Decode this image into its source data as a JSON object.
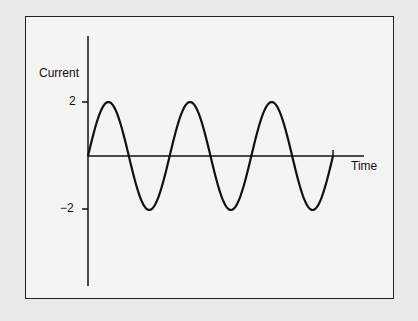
{
  "chart_data": {
    "type": "line",
    "title": "",
    "xlabel": "Time",
    "ylabel": "Current",
    "yticks": [
      2,
      -2
    ],
    "ytick_labels": [
      "2",
      "−2"
    ],
    "ylim": [
      -4.5,
      4.5
    ],
    "grid": false,
    "legend": null,
    "series": [
      {
        "name": "Current",
        "function": "2*sin(t)",
        "amplitude": 2,
        "cycles": 3,
        "start_phase": 0
      }
    ]
  },
  "labels": {
    "ylabel": "Current",
    "xlabel": "Time",
    "ytick_pos": "2",
    "ytick_neg": "−2"
  }
}
